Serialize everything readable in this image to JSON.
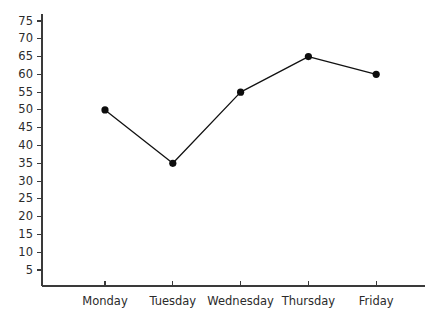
{
  "chart_data": {
    "type": "line",
    "title": "",
    "xlabel": "",
    "ylabel": "",
    "categories": [
      "Monday",
      "Tuesday",
      "Wednesday",
      "Thursday",
      "Friday"
    ],
    "values": [
      50,
      35,
      55,
      65,
      60
    ],
    "series": [
      {
        "name": "",
        "values": [
          50,
          35,
          55,
          65,
          60
        ]
      }
    ],
    "ylim": [
      0,
      75
    ],
    "ytick_start": 5,
    "ytick_step": 5,
    "yticks": [
      5,
      10,
      15,
      20,
      25,
      30,
      35,
      40,
      45,
      50,
      55,
      60,
      65,
      70,
      75
    ],
    "ytick_labels": [
      "5",
      "10",
      "15",
      "20",
      "25",
      "30",
      "35",
      "40",
      "45",
      "50",
      "55",
      "60",
      "65",
      "70",
      "75"
    ],
    "xtick_labels": [
      "Monday",
      "Tuesday",
      "Wednesday",
      "Thursday",
      "Friday"
    ],
    "grid": false,
    "legend": false,
    "legend_position": "none",
    "marker": "circle",
    "marker_filled": true,
    "line_color": "#111111",
    "marker_color": "#0d0d0d",
    "axis_color": "#3a3a3a",
    "text_color": "#2b2b2b",
    "background_color": "#ffffff"
  }
}
